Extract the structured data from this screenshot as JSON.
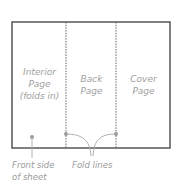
{
  "diagram": {
    "colors": {
      "outline": "#555555",
      "fold_line": "#555555",
      "leader": "#b0b0b0",
      "dot": "#999999",
      "text": "#a0a0a0",
      "background": "#ffffff"
    },
    "sheet": {
      "x": 12,
      "y": 22,
      "width": 158,
      "height": 126
    },
    "fold_lines_x": [
      66,
      116
    ],
    "panels": [
      {
        "name": "interior",
        "lines": [
          "Interior",
          "Page",
          "(folds in)"
        ]
      },
      {
        "name": "back",
        "lines": [
          "Back",
          "Page"
        ]
      },
      {
        "name": "cover",
        "lines": [
          "Cover",
          "Page"
        ]
      }
    ],
    "callouts": {
      "front_side": {
        "lines": [
          "Front side",
          "of sheet"
        ]
      },
      "fold_lines": {
        "lines": [
          "Fold lines"
        ]
      }
    }
  }
}
